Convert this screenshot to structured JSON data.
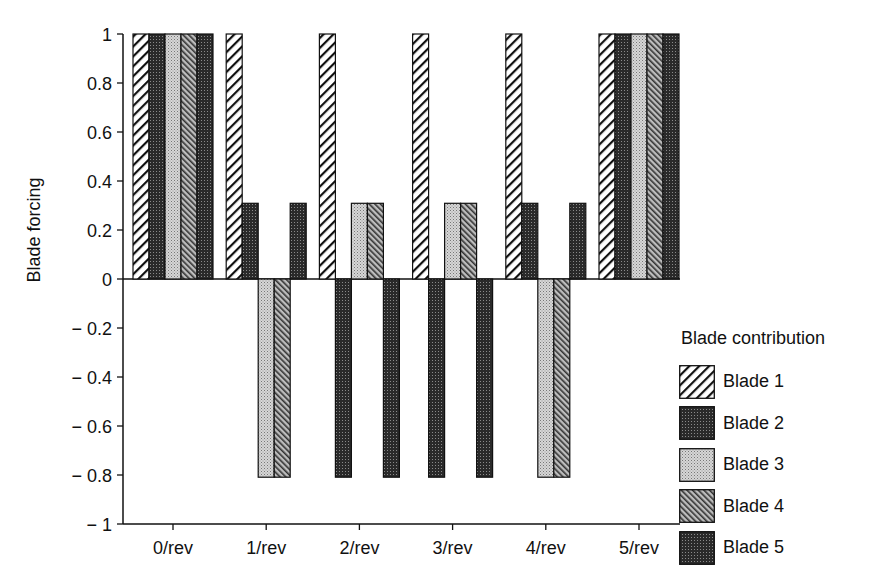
{
  "chart_data": {
    "type": "bar",
    "title": "",
    "xlabel": "",
    "ylabel": "Blade forcing",
    "ylim": [
      -1,
      1
    ],
    "yticks": [
      1,
      0.8,
      0.6,
      0.4,
      0.2,
      0,
      -0.2,
      -0.4,
      -0.6,
      -0.8,
      -1
    ],
    "ytick_labels": [
      "1",
      "0.8",
      "0.6",
      "0.4",
      "0.2",
      "0",
      "− 0.2",
      "− 0.4",
      "− 0.6",
      "− 0.8",
      "− 1"
    ],
    "categories": [
      "0/rev",
      "1/rev",
      "2/rev",
      "3/rev",
      "4/rev",
      "5/rev"
    ],
    "legend_title": "Blade contribution",
    "legend_position": "right",
    "grid": false,
    "series": [
      {
        "name": "Blade 1",
        "pattern": "hatch-forward",
        "values": [
          1,
          1,
          1,
          1,
          1,
          1
        ]
      },
      {
        "name": "Blade 2",
        "pattern": "dark-dots",
        "values": [
          1,
          0.309,
          -0.809,
          -0.809,
          0.309,
          1
        ]
      },
      {
        "name": "Blade 3",
        "pattern": "light-dots",
        "values": [
          1,
          -0.809,
          0.309,
          0.309,
          -0.809,
          1
        ]
      },
      {
        "name": "Blade 4",
        "pattern": "hatch-back",
        "values": [
          1,
          -0.809,
          0.309,
          0.309,
          -0.809,
          1
        ]
      },
      {
        "name": "Blade 5",
        "pattern": "dark-dots",
        "values": [
          1,
          0.309,
          -0.809,
          -0.809,
          0.309,
          1
        ]
      }
    ]
  }
}
